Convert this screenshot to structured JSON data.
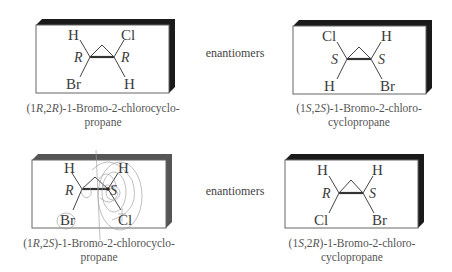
{
  "figure": {
    "rows": [
      {
        "relation_label": "enantiomers",
        "left": {
          "caption_line1_prefix": "(1",
          "caption_c1": "R",
          "caption_sep": ",2",
          "caption_c2": "R",
          "caption_line1_suffix": ")-1-Bromo-2-chlorocyclo-",
          "caption_line2": "propane",
          "atoms": {
            "top_left": "H",
            "top_right": "Cl",
            "bottom_left": "Br",
            "bottom_right": "H"
          },
          "config": {
            "c1": "R",
            "c2": "R"
          }
        },
        "right": {
          "caption_line1_prefix": "(1",
          "caption_c1": "S",
          "caption_sep": ",2",
          "caption_c2": "S",
          "caption_line1_suffix": ")-1-Bromo-2-chloro-",
          "caption_line2": "cyclopropane",
          "atoms": {
            "top_left": "Cl",
            "top_right": "H",
            "bottom_left": "H",
            "bottom_right": "Br"
          },
          "config": {
            "c1": "S",
            "c2": "S"
          }
        }
      },
      {
        "relation_label": "enantiomers",
        "left": {
          "caption_line1_prefix": "(1",
          "caption_c1": "R",
          "caption_sep": ",2",
          "caption_c2": "S",
          "caption_line1_suffix": ")-1-Bromo-2-chlorocyclo-",
          "caption_line2": "propane",
          "atoms": {
            "top_left": "H",
            "top_right": "H",
            "bottom_left": "Br",
            "bottom_right": "Cl"
          },
          "config": {
            "c1": "R",
            "c2": "S"
          },
          "annotated": true
        },
        "right": {
          "caption_line1_prefix": "(1",
          "caption_c1": "S",
          "caption_sep": ",2",
          "caption_c2": "R",
          "caption_line1_suffix": ")-1-Bromo-2-chloro-",
          "caption_line2": "cyclopropane",
          "atoms": {
            "top_left": "H",
            "top_right": "H",
            "bottom_left": "Cl",
            "bottom_right": "Br"
          },
          "config": {
            "c1": "R",
            "c2": "S"
          }
        }
      }
    ]
  },
  "colors": {
    "shadow": "#1a1a1a",
    "text": "#3a3a3a",
    "face": "#ffffff"
  }
}
